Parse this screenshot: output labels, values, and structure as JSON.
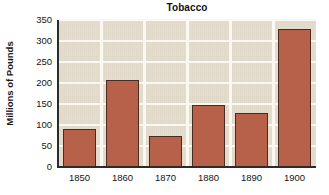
{
  "chart_data": {
    "type": "bar",
    "title": "Tobacco",
    "xlabel": "",
    "ylabel": "Millions of Pounds",
    "categories": [
      "1850",
      "1860",
      "1870",
      "1880",
      "1890",
      "1900"
    ],
    "values": [
      90,
      207,
      74,
      147,
      128,
      329
    ],
    "ylim": [
      0,
      350
    ],
    "yticks": [
      "0",
      "50",
      "100",
      "150",
      "200",
      "250",
      "300",
      "350"
    ],
    "ytick_values": [
      0,
      50,
      100,
      150,
      200,
      250,
      300,
      350
    ],
    "grid": "horizontal and vertical white gridlines",
    "legend": "none",
    "series": [
      {
        "name": "Tobacco production",
        "values": [
          90,
          207,
          74,
          147,
          128,
          329
        ]
      }
    ]
  },
  "style": {
    "bar_color": "#b7604a",
    "bar_edge_color": "#4a2a22",
    "plot_background": "#ded4c0",
    "gridline_color": "#fbf8f1",
    "axis_color": "#2b2b2b",
    "text_color": "#151515",
    "page_background": "#ffffff"
  }
}
